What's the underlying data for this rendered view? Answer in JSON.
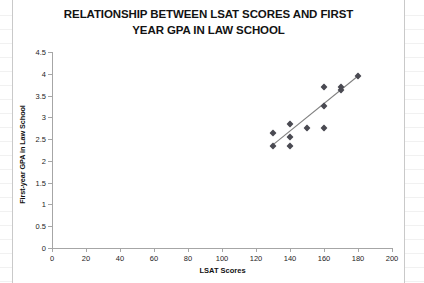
{
  "chart_data": {
    "type": "scatter",
    "title": "RELATIONSHIP BETWEEN LSAT SCORES AND FIRST YEAR GPA IN LAW SCHOOL",
    "title_lines": [
      "RELATIONSHIP BETWEEN LSAT SCORES AND FIRST",
      "YEAR GPA IN LAW SCHOOL"
    ],
    "xlabel": "LSAT Scores",
    "ylabel": "First-year GPA in Law School",
    "xlim": [
      0,
      200
    ],
    "ylim": [
      0,
      4.5
    ],
    "xticks": [
      0,
      20,
      40,
      60,
      80,
      100,
      120,
      140,
      160,
      180,
      200
    ],
    "yticks": [
      0,
      0.5,
      1,
      1.5,
      2,
      2.5,
      3,
      3.5,
      4,
      4.5
    ],
    "xtick_labels": [
      "0",
      "20",
      "40",
      "60",
      "80",
      "100",
      "120",
      "140",
      "160",
      "180",
      "200"
    ],
    "ytick_labels": [
      "0",
      "0.5",
      "1",
      "1.5",
      "2",
      "2.5",
      "3",
      "3.5",
      "4",
      "4.5"
    ],
    "grid": false,
    "legend": false,
    "marker_color": "#4a4a52",
    "marker_shape": "diamond",
    "axis_color": "#a6a6a6",
    "trendline_color": "#808080",
    "points": [
      {
        "x": 130,
        "y": 2.65
      },
      {
        "x": 130,
        "y": 2.35
      },
      {
        "x": 140,
        "y": 2.85
      },
      {
        "x": 140,
        "y": 2.55
      },
      {
        "x": 140,
        "y": 2.35
      },
      {
        "x": 150,
        "y": 2.75
      },
      {
        "x": 160,
        "y": 3.7
      },
      {
        "x": 160,
        "y": 3.25
      },
      {
        "x": 160,
        "y": 2.75
      },
      {
        "x": 170,
        "y": 3.7
      },
      {
        "x": 170,
        "y": 3.63
      },
      {
        "x": 180,
        "y": 3.95
      }
    ],
    "trendline": {
      "x0": 129,
      "y0": 2.34,
      "x1": 180,
      "y1": 3.95
    }
  }
}
